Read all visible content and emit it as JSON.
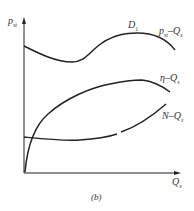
{
  "figure": {
    "caption": "(b)",
    "y_axis_label": "p",
    "y_axis_label_sub": "st",
    "x_axis_label": "Q",
    "x_axis_label_sub": "s",
    "point_label": "D",
    "point_label_sub": "1",
    "curves": [
      {
        "id": "pst-qs",
        "label_main": "p",
        "label_sub": "st",
        "label_tail": "–Q",
        "label_tail_sub": "s"
      },
      {
        "id": "eta-qs",
        "label_main": "η–Q",
        "label_sub": "s"
      },
      {
        "id": "n-qs",
        "label_main": "N–Q",
        "label_sub": "s"
      }
    ]
  },
  "colors": {
    "line": "#222222",
    "text": "#333333",
    "background": "#ffffff"
  }
}
